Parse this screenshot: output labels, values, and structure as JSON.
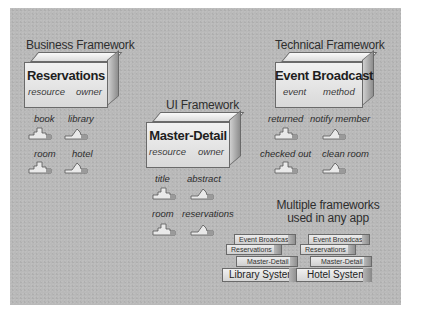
{
  "diagram": {
    "frameworks": [
      {
        "heading": "Business Framework",
        "box": "Reservations",
        "ports": [
          "resource",
          "owner"
        ],
        "plugs": [
          {
            "label": "book",
            "type": "resource"
          },
          {
            "label": "library",
            "type": "owner"
          },
          {
            "label": "room",
            "type": "resource"
          },
          {
            "label": "hotel",
            "type": "owner"
          }
        ]
      },
      {
        "heading": "UI Framework",
        "box": "Master-Detail",
        "ports": [
          "resource",
          "owner"
        ],
        "plugs": [
          {
            "label": "title",
            "type": "resource"
          },
          {
            "label": "abstract",
            "type": "owner"
          },
          {
            "label": "room",
            "type": "resource"
          },
          {
            "label": "reservations",
            "type": "owner"
          }
        ]
      },
      {
        "heading": "Technical Framework",
        "box": "Event Broadcast",
        "ports": [
          "event",
          "method"
        ],
        "plugs": [
          {
            "label": "returned",
            "type": "event"
          },
          {
            "label": "notify member",
            "type": "method"
          },
          {
            "label": "checked out",
            "type": "event"
          },
          {
            "label": "clean room",
            "type": "method"
          }
        ]
      }
    ],
    "composition": {
      "heading_line1": "Multiple frameworks",
      "heading_line2": "used in any app",
      "apps": [
        {
          "name": "Library System",
          "layers": [
            "Event Broadcast",
            "Reservations",
            "Master-Detail"
          ]
        },
        {
          "name": "Hotel System",
          "layers": [
            "Event Broadcast",
            "Reservations",
            "Master-Detail"
          ]
        }
      ]
    },
    "colors": {
      "background": "#b9b9b9",
      "box_face": "#e6e6e6",
      "outline": "#6a6a6a",
      "text": "#2e2e2e"
    }
  }
}
